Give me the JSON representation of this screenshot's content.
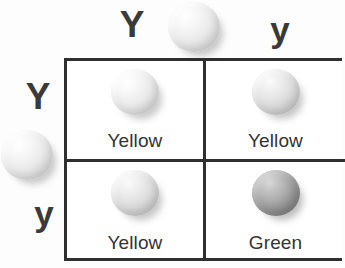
{
  "diagram": {
    "type": "punnett-square",
    "cross": "Yy x Yy",
    "trait": "pea seed color",
    "colors": {
      "grid_line": "#2f2f2f",
      "text": "#333333",
      "allele_text": "#3a3a3a",
      "background": "#fdfdfd"
    }
  },
  "parents": {
    "top": {
      "alleles": [
        {
          "symbol": "Y",
          "kind": "dominant"
        },
        {
          "symbol": "y",
          "kind": "recessive"
        }
      ],
      "pea_icon": "pea-seed-light"
    },
    "left": {
      "alleles": [
        {
          "symbol": "Y",
          "kind": "dominant"
        },
        {
          "symbol": "y",
          "kind": "recessive"
        }
      ],
      "pea_icon": "pea-seed-light"
    }
  },
  "grid": {
    "rows": 2,
    "columns": 2,
    "cells": [
      {
        "genotype": "YY",
        "phenotype": "Yellow",
        "pea_icon": "pea-seed-light",
        "shade": "light"
      },
      {
        "genotype": "Yy",
        "phenotype": "Yellow",
        "pea_icon": "pea-seed-light",
        "shade": "light"
      },
      {
        "genotype": "Yy",
        "phenotype": "Yellow",
        "pea_icon": "pea-seed-light",
        "shade": "light"
      },
      {
        "genotype": "yy",
        "phenotype": "Green",
        "pea_icon": "pea-seed-dark",
        "shade": "dark"
      }
    ]
  }
}
